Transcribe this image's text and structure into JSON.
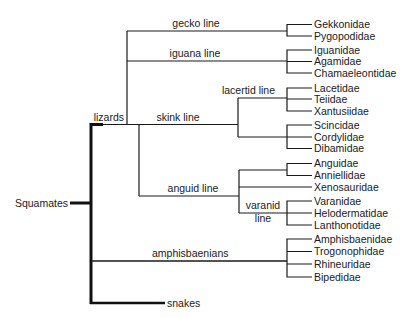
{
  "diagram": {
    "type": "phylogenetic-tree",
    "root": {
      "label": "Squamates",
      "children": [
        {
          "label": "lizards",
          "children": [
            {
              "label": "gecko line",
              "taxa": [
                "Gekkonidae",
                "Pygopodidae"
              ]
            },
            {
              "label": "iguana line",
              "taxa": [
                "Iguanidae",
                "Agamidae",
                "Chamaeleontidae"
              ]
            },
            {
              "label": "skink line",
              "children": [
                {
                  "label": "lacertid line",
                  "taxa": [
                    "Lacetidae",
                    "Teiidae",
                    "Xantusiidae"
                  ]
                },
                {
                  "label": "",
                  "taxa": [
                    "Scincidae",
                    "Cordylidae",
                    "Dibamidae"
                  ]
                }
              ]
            },
            {
              "label": "anguid line",
              "children": [
                {
                  "label": "",
                  "taxa": [
                    "Anguidae",
                    "Anniellidae"
                  ]
                },
                {
                  "label": "",
                  "taxa": [
                    "Xenosauridae"
                  ]
                },
                {
                  "label": "varanid line",
                  "label_lines": [
                    "varanid",
                    "line"
                  ],
                  "taxa": [
                    "Varanidae",
                    "Helodermatidae",
                    "Lanthonotidae"
                  ]
                }
              ]
            }
          ]
        },
        {
          "label": "amphisbaenians",
          "taxa": [
            "Amphisbaenidae",
            "Trogonophidae",
            "Rhineuridae",
            "Bipedidae"
          ]
        },
        {
          "label": "snakes"
        }
      ]
    }
  },
  "labels": {
    "squamates": "Squamates",
    "lizards": "lizards",
    "gecko_line": "gecko line",
    "iguana_line": "iguana line",
    "skink_line": "skink line",
    "lacertid_line": "lacertid line",
    "anguid_line": "anguid line",
    "varanid_line_1": "varanid",
    "varanid_line_2": "line",
    "amphisbaenians": "amphisbaenians",
    "snakes": "snakes"
  },
  "taxa": {
    "gekkonidae": "Gekkonidae",
    "pygopodidae": "Pygopodidae",
    "iguanidae": "Iguanidae",
    "agamidae": "Agamidae",
    "chamaeleontidae": "Chamaeleontidae",
    "lacetidae": "Lacetidae",
    "teiidae": "Teiidae",
    "xantusiidae": "Xantusiidae",
    "scincidae": "Scincidae",
    "cordylidae": "Cordylidae",
    "dibamidae": "Dibamidae",
    "anguidae": "Anguidae",
    "anniellidae": "Anniellidae",
    "xenosauridae": "Xenosauridae",
    "varanidae": "Varanidae",
    "helodermatidae": "Helodermatidae",
    "lanthonotidae": "Lanthonotidae",
    "amphisbaenidae": "Amphisbaenidae",
    "trogonophidae": "Trogonophidae",
    "rhineuridae": "Rhineuridae",
    "bipedidae": "Bipedidae"
  }
}
